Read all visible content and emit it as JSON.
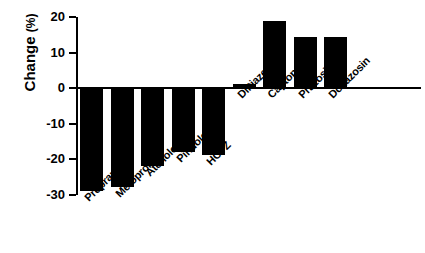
{
  "chart_data": {
    "type": "bar",
    "title": "",
    "subtitle": "",
    "xlabel": "",
    "ylabel": "Change (%)",
    "ylabel_main": "Change",
    "ylabel_unit": "(%)",
    "categories": [
      "Propranolol",
      "Metoprolol",
      "Atenolol",
      "Pindolol",
      "HCTZ",
      "Diltiazem",
      "Captopril",
      "Prazosin",
      "Doxazosin"
    ],
    "values": [
      -29,
      -28,
      -22,
      -18,
      -19,
      1,
      19,
      14.5,
      14.5
    ],
    "ylim": [
      -30,
      20
    ],
    "yticks": [
      20,
      10,
      0,
      -10,
      -20,
      -30
    ],
    "ytick_labels": [
      "20",
      "10",
      "0",
      "-10",
      "-20",
      "-30"
    ],
    "grid": false,
    "legend": null,
    "bar_color": "#000000",
    "axis_color": "#000000",
    "series": [
      {
        "name": "Change",
        "values": [
          -29,
          -28,
          -22,
          -18,
          -19,
          1,
          19,
          14.5,
          14.5
        ]
      }
    ]
  }
}
